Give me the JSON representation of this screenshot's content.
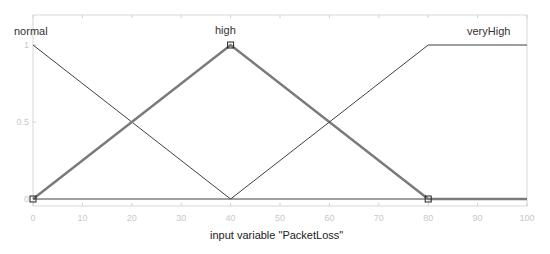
{
  "chart_data": {
    "type": "line",
    "title": "",
    "xlabel": "input variable \"PacketLoss\"",
    "ylabel": "",
    "xlim": [
      0,
      100
    ],
    "ylim": [
      0,
      1
    ],
    "grid": false,
    "x_ticks": [
      0,
      10,
      20,
      30,
      40,
      50,
      60,
      70,
      80,
      90,
      100
    ],
    "y_ticks": [
      0,
      0.5,
      1
    ],
    "series": [
      {
        "name": "normal",
        "shape": "trimf",
        "params": [
          -40,
          0,
          40
        ],
        "x": [
          0,
          40,
          100
        ],
        "y": [
          1,
          0,
          0
        ],
        "highlighted": false
      },
      {
        "name": "high",
        "shape": "trimf",
        "params": [
          0,
          40,
          80
        ],
        "x": [
          0,
          40,
          80,
          100
        ],
        "y": [
          0,
          1,
          0,
          0
        ],
        "highlighted": true
      },
      {
        "name": "veryHigh",
        "shape": "trapmf",
        "params": [
          40,
          80,
          100,
          140
        ],
        "x": [
          0,
          40,
          80,
          100
        ],
        "y": [
          0,
          0,
          1,
          1
        ],
        "highlighted": false
      }
    ],
    "annotations": [
      "normal",
      "high",
      "veryHigh"
    ]
  },
  "labels": {
    "x_axis_title": "input variable \"PacketLoss\"",
    "mf_normal": "normal",
    "mf_high": "high",
    "mf_veryhigh": "veryHigh"
  },
  "colors": {
    "line": "#404040",
    "highlight": "#7a7a7a",
    "axis": "#d0d0d0",
    "tick_text": "#c8c8c8",
    "background": "#ffffff"
  }
}
